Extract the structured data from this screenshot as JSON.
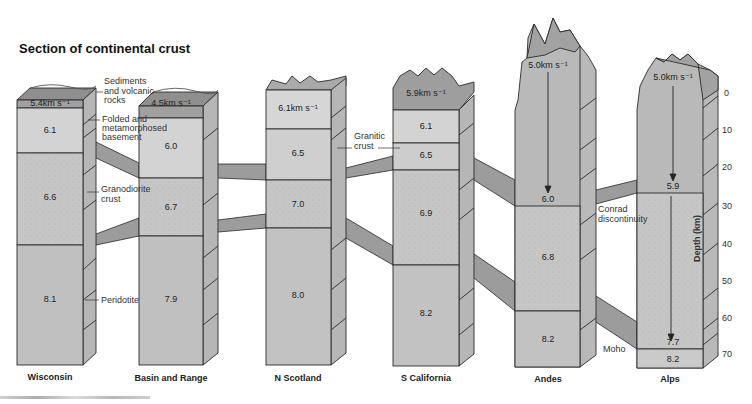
{
  "title": "Section of continental crust",
  "columns": [
    {
      "name": "Wisconsin",
      "layers": [
        "5.4km s⁻¹",
        "6.1",
        "6.6",
        "8.1"
      ]
    },
    {
      "name": "Basin and Range",
      "layers": [
        "4.5km s⁻¹",
        "6.0",
        "6.7",
        "7.9"
      ]
    },
    {
      "name": "N Scotland",
      "layers": [
        "6.1km s⁻¹",
        "6.5",
        "7.0",
        "8.0"
      ]
    },
    {
      "name": "S California",
      "layers": [
        "5.9km s⁻¹",
        "6.1",
        "6.5",
        "6.9",
        "8.2"
      ]
    },
    {
      "name": "Andes",
      "layers": [
        "5.0km s⁻¹",
        "6.0",
        "6.8",
        "8.2"
      ]
    },
    {
      "name": "Alps",
      "layers": [
        "5.0km s⁻¹",
        "5.9",
        "7.7",
        "8.2"
      ]
    }
  ],
  "annotations": {
    "sediments": [
      "Sediments",
      "and volcanic",
      "rocks"
    ],
    "basement": [
      "Folded and",
      "metamorphosed",
      "basement"
    ],
    "granodiorite": [
      "Granodiorite",
      "crust"
    ],
    "peridotite": "Peridotite",
    "granitic": [
      "Granitic",
      "crust"
    ],
    "conrad": [
      "Conrad",
      "discontinuity"
    ],
    "moho": "Moho"
  },
  "depth_axis": {
    "label": "Depth (km)",
    "ticks": [
      "0",
      "10",
      "20",
      "30",
      "40",
      "50",
      "60",
      "70"
    ]
  },
  "colors": {
    "light": "#d2d2d2",
    "mid": "#c4c4c4",
    "dark": "#b0b0b0",
    "top": "#a2a2a2",
    "side": "#b8b8b8",
    "band": "#9c9c9c",
    "line": "#2a2a2a"
  }
}
